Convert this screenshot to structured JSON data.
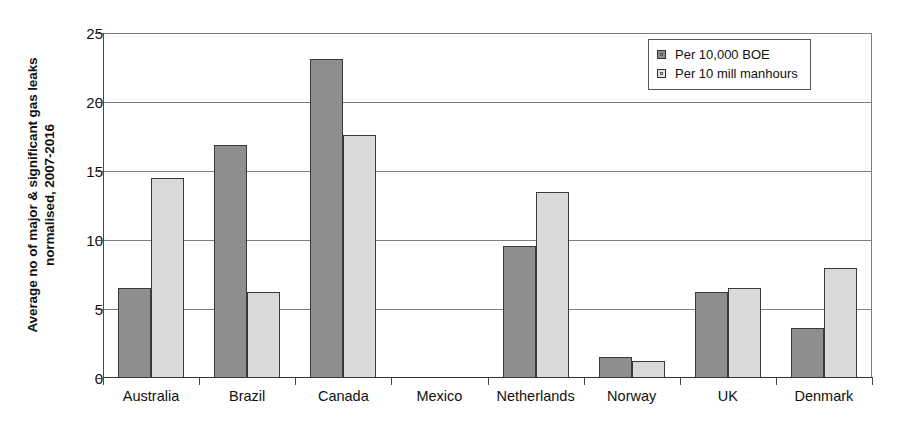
{
  "chart_data": {
    "type": "bar",
    "title": "",
    "xlabel": "",
    "ylabel": "Average no of major & significant gas leaks normalised, 2007-2016",
    "ylabel_line1": "Average no of major & significant gas leaks",
    "ylabel_line2": "normalised, 2007-2016",
    "ylim": [
      0,
      25
    ],
    "yticks": [
      0,
      5,
      10,
      15,
      20,
      25
    ],
    "ytick_labels": [
      "0",
      "5",
      "10",
      "15",
      "20",
      "25"
    ],
    "grid": true,
    "legend_position": "top-right",
    "categories": [
      "Australia",
      "Brazil",
      "Canada",
      "Mexico",
      "Netherlands",
      "Norway",
      "UK",
      "Denmark"
    ],
    "series": [
      {
        "name": "Per 10,000 BOE",
        "color": "#8e8e8e",
        "values": [
          6.5,
          16.9,
          23.1,
          0,
          9.6,
          1.5,
          6.2,
          3.6
        ]
      },
      {
        "name": "Per 10 mill manhours",
        "color": "#d9d9d9",
        "values": [
          14.5,
          6.2,
          17.6,
          0,
          13.5,
          1.2,
          6.5,
          8.0
        ]
      }
    ]
  },
  "legend": {
    "items": [
      {
        "label": "Per 10,000 BOE",
        "swatch": "dark-gray-swatch"
      },
      {
        "label": "Per 10 mill manhours",
        "swatch": "light-gray-swatch"
      }
    ]
  }
}
